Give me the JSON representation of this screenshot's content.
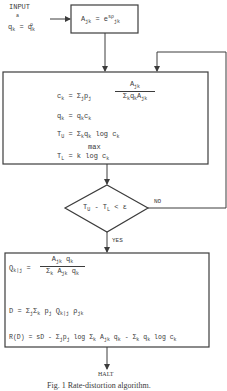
{
  "figure": {
    "caption": "Fig. 1   Rate-distortion algorithm.",
    "input": {
      "label": "INPUT",
      "label_sub": "a",
      "init": {
        "lhs": "q",
        "lhs_sub": "k",
        "eq": "=",
        "rhs": "q",
        "rhs_sub": "k",
        "rhs_sup": "o"
      }
    },
    "init_box": {
      "lhs": "A",
      "lhs_sub": "jk",
      "eq": "= e",
      "exp": "sρ",
      "exp_sub": "jk"
    },
    "iterate_box": {
      "line1": {
        "lhs": "c",
        "lhs_sub": "k",
        "eq": "= Σ",
        "sum_sub": "j",
        "p": "p",
        "p_sub": "j",
        "num": "A",
        "num_sub": "jk",
        "den": "Σ",
        "den_sub1": "k",
        "den_q": "q",
        "den_q_sub": "k",
        "den_A": "A",
        "den_A_sub": "jk"
      },
      "line2": {
        "lhs": "q",
        "lhs_sub": "k",
        "eq": "= q",
        "eq_sub": "k",
        "rhs": "c",
        "rhs_sub": "k"
      },
      "line3": {
        "lhs": "T",
        "lhs_sub": "U",
        "eq": "= Σ",
        "sum_sub": "k",
        "q": "q",
        "q_sub": "k",
        "rest": " log c",
        "rest_sub": "k"
      },
      "line4": {
        "max": "max",
        "lhs": "T",
        "lhs_sub": "L",
        "eq": "=  k",
        "rest": "  log c",
        "rest_sub": "k"
      }
    },
    "decision": {
      "condition": {
        "a": "T",
        "a_sub": "U",
        "op": " - T",
        "b_sub": "L",
        "rest": " < ε"
      },
      "no_label": "NO",
      "yes_label": "YES"
    },
    "output_box": {
      "line1": {
        "lhs": "Q",
        "lhs_sub": "k|j",
        "eq": "=",
        "num": "A",
        "num_sub": "jk",
        "num_q": " q",
        "num_q_sub": "k",
        "den": "Σ",
        "den_sub": "k",
        "den_A": " A",
        "den_A_sub": "jk",
        "den_q": " q",
        "den_q_sub": "k"
      },
      "line2": {
        "text": "D = Σ",
        "s1": "j",
        "s2": "Σ",
        "s2_sub": "k",
        "p": " p",
        "p_sub": "j",
        "Q": " Q",
        "Q_sub": "k|j",
        "rho": " ρ",
        "rho_sub": "jk"
      },
      "line3": {
        "text": "R(D) = sD - Σ",
        "s1": "j",
        "p": "p",
        "p_sub": "j",
        "log": " log Σ",
        "log_sub": "k",
        "A": " A",
        "A_sub": "jk",
        "q": " q",
        "q_sub": "k",
        "minus": " - Σ",
        "minus_sub": "k",
        "q2": " q",
        "q2_sub": "k",
        "tail": " log c",
        "tail_sub": "k"
      }
    },
    "halt_label": "HALT",
    "colors": {
      "line": "#3c3c3c",
      "text": "#3a3a3a",
      "background": "#ffffff"
    }
  }
}
